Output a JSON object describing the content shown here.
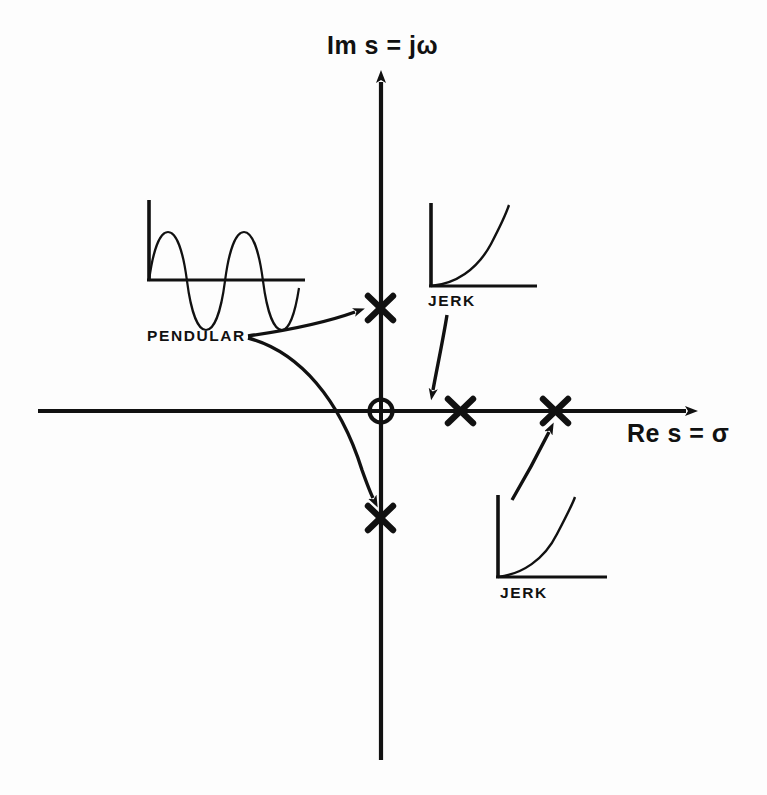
{
  "figure": {
    "type": "s-plane pole location diagram",
    "background_color": "#fdfdfd",
    "ink_color": "#111111"
  },
  "axes": {
    "vertical": {
      "label": "Im s = jω",
      "name": "imaginary-axis",
      "arrow_at": "top"
    },
    "horizontal": {
      "label": "Re s = σ",
      "name": "real-axis",
      "arrow_at": "right"
    },
    "origin": {
      "marker": "circled-cross",
      "name": "origin-marker"
    }
  },
  "poles": [
    {
      "id": "pole-upper-imaginary",
      "marker": "x",
      "x": 381,
      "y": 308,
      "group": "pendular"
    },
    {
      "id": "pole-lower-imaginary",
      "marker": "x",
      "x": 381,
      "y": 518,
      "group": "pendular"
    },
    {
      "id": "pole-real-inner",
      "marker": "x",
      "x": 460,
      "y": 411,
      "group": "jerk"
    },
    {
      "id": "pole-real-outer",
      "marker": "x",
      "x": 555,
      "y": 411,
      "group": "jerk"
    }
  ],
  "insets": [
    {
      "label": "PENDULAR",
      "name": "inset-pendular",
      "waveform": "sinusoid",
      "description": "undamped oscillation, constant amplitude sine wave"
    },
    {
      "label": "JERK",
      "name": "inset-jerk-upper",
      "waveform": "growing-exponential",
      "description": "monotonically increasing exponential response"
    },
    {
      "label": "JERK",
      "name": "inset-jerk-lower",
      "waveform": "growing-exponential",
      "description": "monotonically increasing exponential response"
    }
  ],
  "annotations": [
    {
      "name": "arrow-pendular-to-upper-pole",
      "from": "PENDULAR",
      "to": "pole-upper-imaginary",
      "style": "curved"
    },
    {
      "name": "arrow-pendular-to-lower-pole",
      "from": "PENDULAR",
      "to": "pole-lower-imaginary",
      "style": "curved"
    },
    {
      "name": "arrow-jerk-upper-to-pole",
      "from": "JERK",
      "to": "pole-real-inner",
      "style": "straight"
    },
    {
      "name": "arrow-jerk-lower-to-pole",
      "from": "JERK",
      "to": "pole-real-outer",
      "style": "straight"
    }
  ]
}
